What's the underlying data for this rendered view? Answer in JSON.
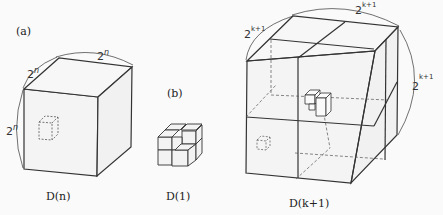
{
  "panels": {
    "a": {
      "tag": "(a)",
      "caption": "D(n)",
      "edge_label": "2",
      "edge_exp": "n"
    },
    "b": {
      "tag": "(b)",
      "caption": "D(1)"
    },
    "c": {
      "caption": "D(k+1)",
      "edge_label": "2",
      "edge_exp": "k+1"
    }
  },
  "colors": {
    "line": "#333333",
    "dash": "#555555",
    "bg": "#fafafa"
  }
}
